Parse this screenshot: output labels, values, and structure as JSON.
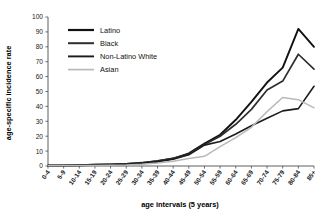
{
  "chart_data": {
    "type": "line",
    "title": "",
    "xlabel": "age intervals (5 years)",
    "ylabel": "age-specific incidence rate",
    "ylim": [
      0,
      100
    ],
    "ytick_step": 10,
    "grid": false,
    "legend_position": "top-left-inside",
    "categories": [
      "0-4",
      "5-9",
      "10-14",
      "15-19",
      "20-24",
      "25-29",
      "30-34",
      "35-39",
      "40-44",
      "45-49",
      "50-54",
      "55-59",
      "60-64",
      "65-69",
      "70-74",
      "75-79",
      "80-84",
      "85+"
    ],
    "yticks": [
      0,
      10,
      20,
      30,
      40,
      50,
      60,
      70,
      80,
      90,
      100
    ],
    "series": [
      {
        "name": "Latino",
        "color": "#111111",
        "width": 1.9,
        "values": [
          0.3,
          0.4,
          0.5,
          0.8,
          1.0,
          1.3,
          2.0,
          3.2,
          5.0,
          8.5,
          15.0,
          21.0,
          31.0,
          43.0,
          56.0,
          66.0,
          92.0,
          80.0
        ]
      },
      {
        "name": "Black",
        "color": "#2e2e2e",
        "width": 1.7,
        "values": [
          0.3,
          0.4,
          0.6,
          0.9,
          1.1,
          1.4,
          2.2,
          3.4,
          5.2,
          8.0,
          14.5,
          20.0,
          28.0,
          38.0,
          51.0,
          57.0,
          75.0,
          65.0
        ]
      },
      {
        "name": "Non-Latino White",
        "color": "#1c1c1c",
        "width": 1.6,
        "values": [
          0.2,
          0.3,
          0.4,
          0.6,
          0.8,
          1.1,
          1.8,
          2.8,
          4.5,
          7.5,
          14.0,
          16.5,
          21.5,
          27.0,
          32.0,
          37.0,
          38.5,
          53.5
        ]
      },
      {
        "name": "Asian",
        "color": "#b9b9b9",
        "width": 1.5,
        "values": [
          0.2,
          0.3,
          0.3,
          0.4,
          0.5,
          0.7,
          1.2,
          2.0,
          3.2,
          5.0,
          6.5,
          13.0,
          19.0,
          26.0,
          36.5,
          46.0,
          44.5,
          39.0
        ]
      }
    ],
    "legend": [
      {
        "label": "Latino",
        "color": "#111111",
        "width": 2.2
      },
      {
        "label": "Black",
        "color": "#2e2e2e",
        "width": 2.0
      },
      {
        "label": "Non-Latino White",
        "color": "#1c1c1c",
        "width": 1.9
      },
      {
        "label": "Asian",
        "color": "#b9b9b9",
        "width": 1.7
      }
    ]
  }
}
